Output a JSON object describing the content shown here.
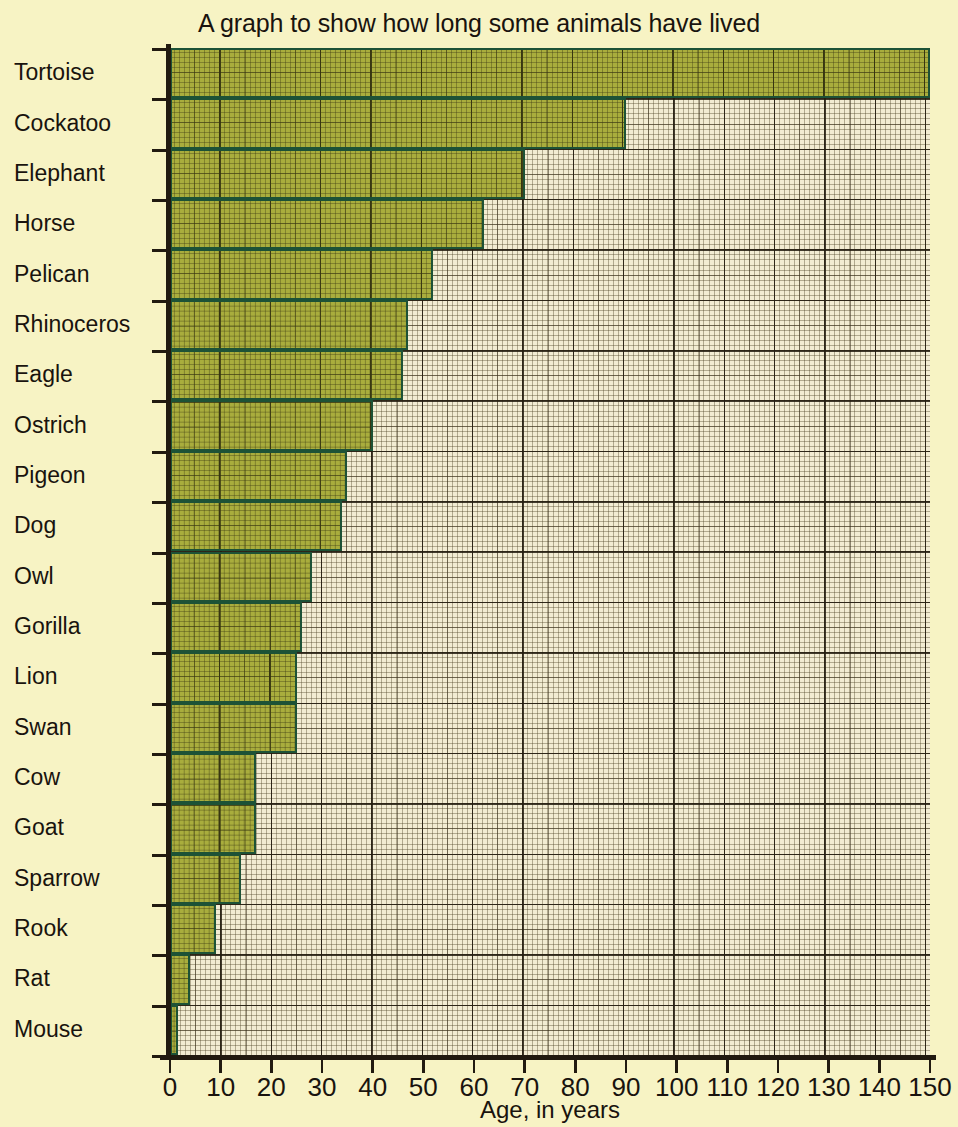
{
  "chart_data": {
    "type": "bar",
    "orientation": "horizontal",
    "title": "A graph to show how long some animals have lived",
    "xlabel": "Age, in years",
    "ylabel": "",
    "xlim": [
      0,
      150
    ],
    "xticks": [
      0,
      10,
      20,
      30,
      40,
      50,
      60,
      70,
      80,
      90,
      100,
      110,
      120,
      130,
      140,
      150
    ],
    "xtick_labels": [
      "0",
      "10",
      "20",
      "30",
      "40",
      "50",
      "60",
      "70",
      "80",
      "90",
      "100",
      "110",
      "120",
      "130",
      "140",
      "150"
    ],
    "grid": true,
    "grid_minor_step": 1,
    "grid_major_step": 10,
    "legend": "none",
    "categories": [
      "Tortoise",
      "Cockatoo",
      "Elephant",
      "Horse",
      "Pelican",
      "Rhinoceros",
      "Eagle",
      "Ostrich",
      "Pigeon",
      "Dog",
      "Owl",
      "Gorilla",
      "Lion",
      "Swan",
      "Cow",
      "Goat",
      "Sparrow",
      "Rook",
      "Rat",
      "Mouse"
    ],
    "values": [
      150,
      90,
      70,
      62,
      52,
      47,
      46,
      40,
      35,
      34,
      28,
      26,
      25,
      25,
      17,
      17,
      14,
      9,
      4,
      1.5
    ],
    "bar_fill_color": "#a9ad3d",
    "bar_border_color": "#1d5236",
    "background_color": "#f7f3c4",
    "plot_background_color": "#f2ecd2",
    "text_color": "#19130e"
  }
}
